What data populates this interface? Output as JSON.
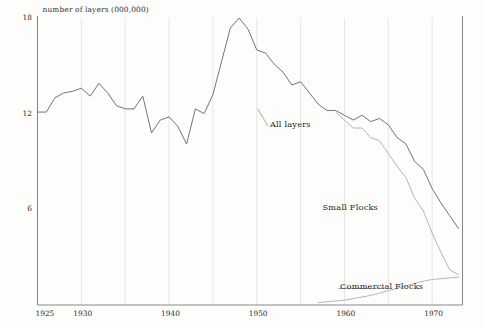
{
  "chart_data": {
    "type": "line",
    "title": "",
    "subtitle": "",
    "ylabel": "number of layers (000,000)",
    "xlabel": "",
    "xlim": [
      1925,
      1973
    ],
    "ylim": [
      0,
      18
    ],
    "grid": "vertical-only",
    "legend_position": "inline-annotations",
    "yticks": [
      "18",
      "12",
      "6"
    ],
    "ytick_values": [
      18,
      12,
      6
    ],
    "xticks": [
      "1925",
      "1930",
      "1940",
      "1950",
      "1960",
      "1970"
    ],
    "xtick_values": [
      1925,
      1930,
      1940,
      1950,
      1960,
      1970
    ],
    "gridline_years": [
      1930,
      1935,
      1940,
      1945,
      1950,
      1955,
      1960,
      1965,
      1970
    ],
    "annotations": [
      {
        "text": "All layers",
        "x": 1951.5,
        "y": 11.3
      },
      {
        "text": "Small Flocks",
        "x": 1957.5,
        "y": 6.1
      },
      {
        "text": "Commercial Flocks",
        "x": 1959.5,
        "y": 1.1
      }
    ],
    "series": [
      {
        "name": "All layers",
        "color": "#6e6e6e",
        "x": [
          1925,
          1926,
          1927,
          1928,
          1929,
          1930,
          1931,
          1932,
          1933,
          1934,
          1935,
          1936,
          1937,
          1938,
          1939,
          1940,
          1941,
          1942,
          1943,
          1944,
          1945,
          1946,
          1947,
          1948,
          1949,
          1950,
          1951,
          1952,
          1953,
          1954,
          1955,
          1956,
          1957,
          1958,
          1959,
          1960,
          1961,
          1962,
          1963,
          1964,
          1965,
          1966,
          1967,
          1968,
          1969,
          1970,
          1971,
          1972,
          1973
        ],
        "values": [
          12.1,
          12.1,
          13.0,
          13.3,
          13.4,
          13.6,
          13.1,
          13.9,
          13.3,
          12.5,
          12.3,
          12.3,
          13.1,
          10.8,
          11.6,
          11.8,
          11.2,
          10.1,
          12.3,
          12.0,
          13.2,
          15.3,
          17.4,
          18.0,
          17.3,
          16.0,
          15.8,
          15.1,
          14.6,
          13.8,
          14.0,
          13.3,
          12.6,
          12.2,
          12.2,
          11.9,
          11.6,
          11.9,
          11.5,
          11.7,
          11.3,
          10.5,
          10.1,
          9.0,
          8.5,
          7.3,
          6.4,
          5.6,
          4.8
        ],
        "note": "darker upper curve; total of small plus commercial flocks"
      },
      {
        "name": "Small Flocks",
        "color": "#b0b0b0",
        "x": [
          1959,
          1960,
          1961,
          1962,
          1963,
          1964,
          1965,
          1966,
          1967,
          1968,
          1969,
          1970,
          1971,
          1972,
          1973
        ],
        "values": [
          12.1,
          11.6,
          11.1,
          11.1,
          10.5,
          10.3,
          9.5,
          8.7,
          8.0,
          6.7,
          5.9,
          4.5,
          3.3,
          2.2,
          1.9
        ],
        "note": "lighter curve; splits away from All layers about 1959 and falls faster"
      },
      {
        "name": "Commercial Flocks",
        "color": "#b0b0b0",
        "x": [
          1957,
          1958,
          1959,
          1960,
          1961,
          1962,
          1963,
          1964,
          1965,
          1966,
          1967,
          1968,
          1969,
          1970,
          1971,
          1972,
          1973
        ],
        "values": [
          0.15,
          0.2,
          0.25,
          0.3,
          0.4,
          0.5,
          0.6,
          0.75,
          0.9,
          1.05,
          1.2,
          1.35,
          1.5,
          1.6,
          1.65,
          1.7,
          1.75
        ],
        "note": "lighter low curve rising slowly near the baseline at the right"
      }
    ]
  }
}
